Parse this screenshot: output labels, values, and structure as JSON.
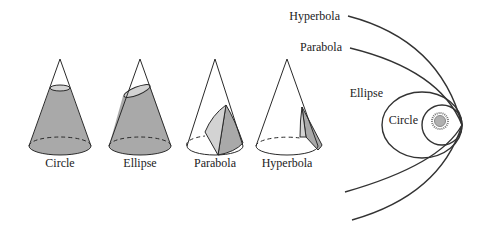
{
  "cones": [
    {
      "id": "circle",
      "label": "Circle"
    },
    {
      "id": "ellipse",
      "label": "Ellipse"
    },
    {
      "id": "parabola",
      "label": "Parabola"
    },
    {
      "id": "hyperbola",
      "label": "Hyperbola"
    }
  ],
  "orbits": {
    "hyperbola": "Hyperbola",
    "parabola": "Parabola",
    "ellipse": "Ellipse",
    "circle": "Circle"
  },
  "colors": {
    "shade_dark": "#a9a9a9",
    "shade_light": "#d3d3d3",
    "line": "#2a2a2a",
    "sun": "#b0b0b0"
  }
}
